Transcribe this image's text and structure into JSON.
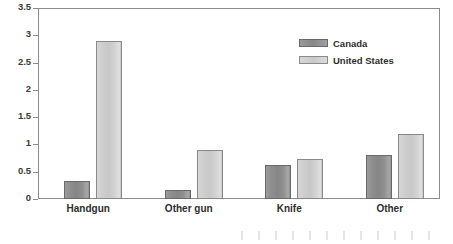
{
  "chart_data": {
    "type": "bar",
    "title": "",
    "subtitle": "",
    "xlabel": "",
    "ylabel": "",
    "categories": [
      "Handgun",
      "Other gun",
      "Knife",
      "Other"
    ],
    "series": [
      {
        "name": "Canada",
        "color": "#909090",
        "values": [
          0.33,
          0.17,
          0.62,
          0.8
        ]
      },
      {
        "name": "United States",
        "color": "#d0d0d0",
        "values": [
          2.9,
          0.9,
          0.73,
          1.2
        ]
      }
    ],
    "ylim": [
      0,
      3.5
    ],
    "ytick_values": [
      0,
      0.5,
      1,
      1.5,
      2,
      2.5,
      3,
      3.5
    ],
    "ytick_labels": [
      "0",
      "0.5",
      "1",
      "1.5",
      "2",
      "2.5",
      "3",
      "3.5"
    ],
    "grid": false,
    "legend_position": "top-right",
    "legend_entries": [
      "Canada",
      "United States"
    ]
  },
  "axis": {
    "y_ticks": [
      {
        "label": "3.5",
        "value": 3.5
      },
      {
        "label": "3",
        "value": 3
      },
      {
        "label": "2.5",
        "value": 2.5
      },
      {
        "label": "2",
        "value": 2
      },
      {
        "label": "1.5",
        "value": 1.5
      },
      {
        "label": "1",
        "value": 1
      },
      {
        "label": "0.5",
        "value": 0.5
      },
      {
        "label": "0",
        "value": 0
      }
    ]
  }
}
